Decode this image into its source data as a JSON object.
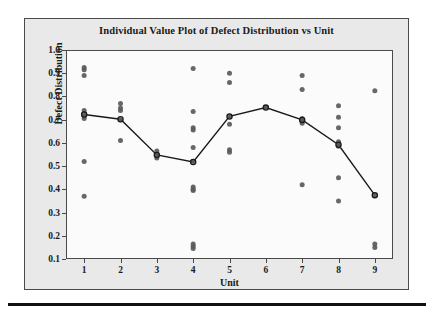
{
  "chart_data": {
    "type": "scatter",
    "title": "Individual Value Plot of Defect Distribution vs Unit",
    "xlabel": "Unit",
    "ylabel": "Defect Distribution",
    "grid": false,
    "legend": null,
    "xlim": [
      0.5,
      9.5
    ],
    "ylim": [
      0.1,
      1.0
    ],
    "ytick_labels": [
      "1.0",
      "0.9",
      "0.8",
      "0.7",
      "0.6",
      "0.5",
      "0.4",
      "0.3",
      "0.2",
      "0.1"
    ],
    "ytick_values": [
      1.0,
      0.9,
      0.8,
      0.7,
      0.6,
      0.5,
      0.4,
      0.3,
      0.2,
      0.1
    ],
    "xtick_labels": [
      "1",
      "2",
      "3",
      "4",
      "5",
      "6",
      "7",
      "8",
      "9"
    ],
    "xtick_values": [
      1,
      2,
      3,
      4,
      5,
      6,
      7,
      8,
      9
    ],
    "point_color": "#5a5a5a",
    "mean_line_color": "#1a1a1a",
    "categories": [
      1,
      2,
      3,
      4,
      5,
      6,
      7,
      8,
      9
    ],
    "groups": [
      {
        "unit": 1,
        "values": [
          0.925,
          0.915,
          0.89,
          0.74,
          0.725,
          0.715,
          0.705,
          0.52,
          0.37
        ],
        "mean": 0.722
      },
      {
        "unit": 2,
        "values": [
          0.77,
          0.75,
          0.74,
          0.7,
          0.61
        ],
        "mean": 0.702
      },
      {
        "unit": 3,
        "values": [
          0.565,
          0.55,
          0.535
        ],
        "mean": 0.548
      },
      {
        "unit": 4,
        "values": [
          0.92,
          0.735,
          0.665,
          0.655,
          0.58,
          0.52,
          0.41,
          0.4,
          0.395,
          0.165,
          0.155,
          0.145
        ],
        "mean": 0.518
      },
      {
        "unit": 5,
        "values": [
          0.9,
          0.86,
          0.715,
          0.68,
          0.57,
          0.56
        ],
        "mean": 0.714
      },
      {
        "unit": 6,
        "values": [
          0.752
        ],
        "mean": 0.752
      },
      {
        "unit": 7,
        "values": [
          0.89,
          0.83,
          0.705,
          0.695,
          0.685,
          0.42
        ],
        "mean": 0.699
      },
      {
        "unit": 8,
        "values": [
          0.76,
          0.71,
          0.665,
          0.605,
          0.59,
          0.585,
          0.45,
          0.35
        ],
        "mean": 0.592
      },
      {
        "unit": 9,
        "values": [
          0.825,
          0.375,
          0.165,
          0.15
        ],
        "mean": 0.375
      }
    ],
    "mean_series": {
      "name": "Mean",
      "x": [
        1,
        2,
        3,
        4,
        5,
        6,
        7,
        8,
        9
      ],
      "values": [
        0.722,
        0.702,
        0.548,
        0.518,
        0.714,
        0.752,
        0.699,
        0.592,
        0.375
      ]
    }
  }
}
